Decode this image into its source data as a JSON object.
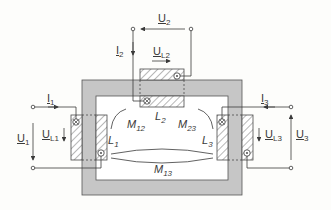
{
  "colors": {
    "core_fill": "#c6c6c6",
    "window_fill": "#ffffff",
    "line": "#4a4a4a",
    "text": "#3a3a3a"
  },
  "ports": {
    "port1": {
      "voltage": {
        "symbol": "U",
        "sub": "1"
      },
      "current": {
        "symbol": "I",
        "sub": "1"
      }
    },
    "port2": {
      "voltage": {
        "symbol": "U",
        "sub": "2"
      },
      "current": {
        "symbol": "I",
        "sub": "2"
      }
    },
    "port3": {
      "voltage": {
        "symbol": "U",
        "sub": "3"
      },
      "current": {
        "symbol": "I",
        "sub": "3"
      }
    }
  },
  "coils": {
    "coil1": {
      "label": "L",
      "sub": "1",
      "voltage": {
        "symbol": "U",
        "sub": "L1"
      },
      "start_mark": "cross",
      "end_mark": "dot"
    },
    "coil2": {
      "label": "L",
      "sub": "2",
      "voltage": {
        "symbol": "U",
        "sub": "L2"
      },
      "start_mark": "cross",
      "end_mark": "dot"
    },
    "coil3": {
      "label": "L",
      "sub": "3",
      "voltage": {
        "symbol": "U",
        "sub": "L3"
      },
      "start_mark": "cross",
      "end_mark": "dot"
    }
  },
  "mutual_inductances": [
    {
      "symbol": "M",
      "sub": "12"
    },
    {
      "symbol": "M",
      "sub": "23"
    },
    {
      "symbol": "M",
      "sub": "13"
    }
  ],
  "icons": {
    "cross_mark": "⊗",
    "dot_mark": "⊙"
  }
}
